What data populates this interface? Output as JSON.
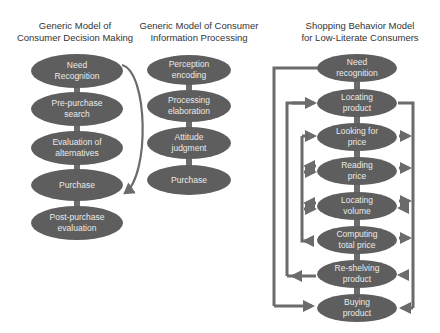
{
  "colors": {
    "node_fill": "#5e5e5e",
    "node_text": "#e8e8e8",
    "arrow": "#6b6b6b",
    "background": "#ffffff",
    "title_text": "#333333"
  },
  "models": [
    {
      "title_line1": "Generic Model of",
      "title_line2": "Consumer Decision Making",
      "nodes": [
        {
          "line1": "Need",
          "line2": "Recognition"
        },
        {
          "line1": "Pre-purchase",
          "line2": "search"
        },
        {
          "line1": "Evaluation of",
          "line2": "alternatives"
        },
        {
          "line1": "Purchase",
          "line2": ""
        },
        {
          "line1": "Post-purchase",
          "line2": "evaluation"
        }
      ]
    },
    {
      "title_line1": "Generic Model of Consumer",
      "title_line2": "Information Processing",
      "nodes": [
        {
          "line1": "Perception",
          "line2": "encoding"
        },
        {
          "line1": "Processing",
          "line2": "elaboration"
        },
        {
          "line1": "Attitude",
          "line2": "judgment"
        },
        {
          "line1": "Purchase",
          "line2": ""
        }
      ]
    },
    {
      "title_line1": "Shopping Behavior Model",
      "title_line2": "for Low-Literate Consumers",
      "nodes": [
        {
          "line1": "Need",
          "line2": "recognition"
        },
        {
          "line1": "Locating",
          "line2": "product"
        },
        {
          "line1": "Looking for",
          "line2": "price"
        },
        {
          "line1": "Reading",
          "line2": "price"
        },
        {
          "line1": "Locating",
          "line2": "volume"
        },
        {
          "line1": "Computing",
          "line2": "total price"
        },
        {
          "line1": "Re-shelving",
          "line2": "product"
        },
        {
          "line1": "Buying",
          "line2": "product"
        }
      ]
    }
  ]
}
